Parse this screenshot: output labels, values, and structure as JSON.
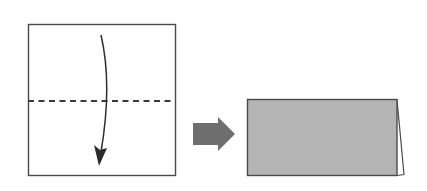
{
  "diagram": {
    "title": "Fold paper in half along the dashed line",
    "steps": [
      {
        "label": "Step 1: square sheet with horizontal valley-fold line; fold top half down",
        "shape": "square",
        "fill": "#ffffff",
        "stroke": "#4a4a4a",
        "fold_line": "dashed horizontal at middle",
        "fold_direction": "top edge down to bottom edge"
      },
      {
        "label": "transition",
        "shape": "block-arrow-right",
        "fill": "#6e6e6e"
      },
      {
        "label": "Step 2: result folded rectangle (half height)",
        "shape": "rectangle",
        "fill": "#b4b4b4",
        "stroke": "#4a4a4a",
        "edge_detail": "back layer visible at right edge"
      }
    ]
  }
}
